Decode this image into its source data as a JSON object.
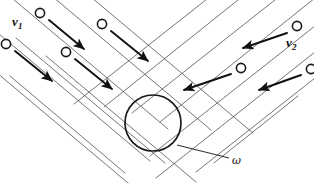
{
  "figure": {
    "type": "colliding-beams-schematic",
    "width": 314,
    "height": 185,
    "background_color": "#ffffff"
  },
  "labels": {
    "velocity_left": {
      "symbol": "v",
      "subscript": "1",
      "x": 12,
      "y": 15
    },
    "velocity_right": {
      "symbol": "v",
      "subscript": "2",
      "x": 286,
      "y": 36
    },
    "omega": {
      "text": "ω",
      "x": 232,
      "y": 155
    },
    "caption": {
      "text": "do collisions",
      "x": 1,
      "y": 147
    }
  },
  "colors": {
    "beam_line": "#5c5c5c",
    "arrow": "#111111",
    "particle_stroke": "#1a1a1a",
    "particle_fill": "#ffffff",
    "interaction_circle": "#1a1a1a",
    "leader_line": "#2a2a2a",
    "text": "#121212"
  },
  "geometry": {
    "beam_left": {
      "direction_degrees": 40,
      "note": "beam travelling down-right",
      "lines": [
        {
          "x1": 7,
          "y1": -6,
          "x2": 168,
          "y2": 129
        },
        {
          "x1": 40,
          "y1": -14,
          "x2": 211,
          "y2": 130
        },
        {
          "x1": 73,
          "y1": -18,
          "x2": 253,
          "y2": 133
        },
        {
          "x1": -14,
          "y1": 23,
          "x2": 150,
          "y2": 161
        },
        {
          "x1": 16,
          "y1": 38,
          "x2": 165,
          "y2": 163
        },
        {
          "x1": -22,
          "y1": 57,
          "x2": 128,
          "y2": 183
        },
        {
          "x1": 46,
          "y1": 56,
          "x2": 196,
          "y2": 182
        },
        {
          "x1": 10,
          "y1": 76,
          "x2": 125,
          "y2": 173
        }
      ]
    },
    "beam_right": {
      "direction_degrees": 200,
      "note": "beam travelling down-left",
      "lines": [
        {
          "x1": 320,
          "y1": -6,
          "x2": 160,
          "y2": 122
        },
        {
          "x1": 320,
          "y1": 22,
          "x2": 150,
          "y2": 156
        },
        {
          "x1": 320,
          "y1": 48,
          "x2": 156,
          "y2": 178
        },
        {
          "x1": 290,
          "y1": -12,
          "x2": 132,
          "y2": 113
        },
        {
          "x1": 258,
          "y1": -16,
          "x2": 104,
          "y2": 107
        },
        {
          "x1": 320,
          "y1": 74,
          "x2": 196,
          "y2": 172
        },
        {
          "x1": 298,
          "y1": 96,
          "x2": 214,
          "y2": 163
        },
        {
          "x1": 226,
          "y1": -16,
          "x2": 74,
          "y2": 104
        }
      ]
    },
    "interaction_region": {
      "cx": 153,
      "cy": 123,
      "r": 28
    },
    "leader": {
      "x1": 177,
      "y1": 145,
      "x2": 229,
      "y2": 158
    }
  },
  "particles_left": [
    {
      "cx": 40,
      "cy": 13,
      "arrow": {
        "x1": 49,
        "y1": 20,
        "x2": 84,
        "y2": 49
      }
    },
    {
      "cx": 6,
      "cy": 44,
      "arrow": {
        "x1": 15,
        "y1": 51,
        "x2": 52,
        "y2": 81
      }
    },
    {
      "cx": 102,
      "cy": 24,
      "arrow": {
        "x1": 111,
        "y1": 31,
        "x2": 148,
        "y2": 61
      }
    },
    {
      "cx": 66,
      "cy": 52,
      "arrow": {
        "x1": 75,
        "y1": 59,
        "x2": 112,
        "y2": 89
      }
    }
  ],
  "particles_right": [
    {
      "cx": 297,
      "cy": 26,
      "arrow": {
        "x1": 287,
        "y1": 33,
        "x2": 243,
        "y2": 48
      }
    },
    {
      "cx": 241,
      "cy": 68,
      "arrow": {
        "x1": 231,
        "y1": 74,
        "x2": 184,
        "y2": 90
      }
    },
    {
      "cx": 311,
      "cy": 69,
      "arrow": {
        "x1": 301,
        "y1": 75,
        "x2": 259,
        "y2": 90
      }
    }
  ],
  "particle_radius": 4.6
}
